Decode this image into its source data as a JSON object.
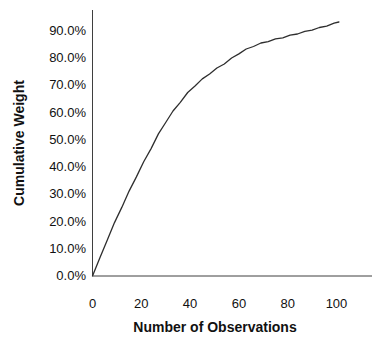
{
  "figure": {
    "background": "#ffffff"
  },
  "chart_data": {
    "type": "line",
    "title": "",
    "xlabel": "Number of Observations",
    "ylabel": "Cumulative Weight",
    "xlim": [
      0,
      115
    ],
    "ylim_percent": [
      0,
      97.5
    ],
    "grid": false,
    "legend": "none",
    "line_color": "#2e2e2e",
    "axis_color": "#3f3f3f",
    "text_color": "#111111",
    "x_ticks": [
      {
        "v": 0,
        "label": "0"
      },
      {
        "v": 20,
        "label": "20"
      },
      {
        "v": 40,
        "label": "40"
      },
      {
        "v": 60,
        "label": "60"
      },
      {
        "v": 80,
        "label": "80"
      },
      {
        "v": 100,
        "label": "100"
      }
    ],
    "y_ticks": [
      {
        "v": 0,
        "label": "0.0%"
      },
      {
        "v": 10,
        "label": "10.0%"
      },
      {
        "v": 20,
        "label": "20.0%"
      },
      {
        "v": 30,
        "label": "30.0%"
      },
      {
        "v": 40,
        "label": "40.0%"
      },
      {
        "v": 50,
        "label": "50.0%"
      },
      {
        "v": 60,
        "label": "60.0%"
      },
      {
        "v": 70,
        "label": "70.0%"
      },
      {
        "v": 80,
        "label": "80.0%"
      },
      {
        "v": 90,
        "label": "90.0%"
      }
    ],
    "series": [
      {
        "name": "cumulative-weight",
        "x": [
          0,
          3,
          6,
          9,
          12,
          15,
          18,
          21,
          24,
          27,
          30,
          33,
          36,
          39,
          42,
          45,
          48,
          51,
          54,
          57,
          60,
          63,
          66,
          69,
          72,
          75,
          78,
          81,
          84,
          87,
          90,
          93,
          96,
          99,
          101
        ],
        "y_percent": [
          0,
          6.6,
          13.0,
          19.6,
          25.2,
          31.2,
          36.4,
          42.0,
          46.8,
          52.2,
          56.4,
          60.6,
          63.8,
          67.4,
          69.8,
          72.4,
          74.2,
          76.4,
          77.9,
          80.1,
          81.6,
          83.4,
          84.3,
          85.6,
          86.1,
          87.1,
          87.5,
          88.5,
          88.9,
          89.9,
          90.3,
          91.3,
          91.8,
          92.9,
          93.3
        ]
      }
    ]
  }
}
